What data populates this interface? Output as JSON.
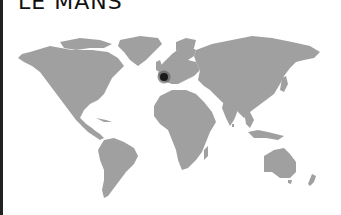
{
  "title": "LE MANS",
  "map": {
    "land_color": "#a0a0a0",
    "background_color": "#ffffff",
    "marker": {
      "label": "Le Mans",
      "x": 164,
      "y": 77,
      "color": "#1a1a1a",
      "halo_color": "#555555"
    }
  }
}
